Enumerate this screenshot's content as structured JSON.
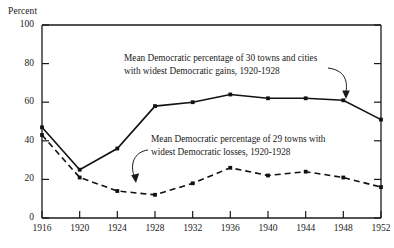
{
  "chart_data": {
    "type": "line",
    "title": "",
    "subtitle": "",
    "xlabel": "",
    "ylabel": "Percent",
    "grid": false,
    "legend_position": "inline-annotations",
    "x": [
      1916,
      1920,
      1924,
      1928,
      1932,
      1936,
      1940,
      1944,
      1948,
      1952
    ],
    "xtick_labels": [
      "1916",
      "1920",
      "1924",
      "1928",
      "1932",
      "1936",
      "1940",
      "1944",
      "1948",
      "1952"
    ],
    "ytick_labels": [
      "0",
      "20",
      "40",
      "60",
      "80",
      "100"
    ],
    "yticks": [
      0,
      20,
      40,
      60,
      80,
      100
    ],
    "xlim": [
      1916,
      1952
    ],
    "ylim": [
      0,
      100
    ],
    "series": [
      {
        "name": "Mean Democratic percentage of 30 towns and cities with widest Democratic gains, 1920-1928",
        "style": "solid",
        "color": "#111111",
        "marker": "dot",
        "values": [
          47,
          25,
          36,
          58,
          60,
          64,
          62,
          62,
          61,
          51
        ]
      },
      {
        "name": "Mean Democratic percentage of 29 towns with widest Democratic losses, 1920-1928",
        "style": "dashed",
        "color": "#111111",
        "marker": "dot",
        "values": [
          43,
          21,
          14,
          12,
          18,
          26,
          22,
          24,
          21,
          16
        ]
      }
    ],
    "annotations": [
      {
        "id": "gains",
        "lines": [
          "Mean Democratic percentage of 30 towns and cities",
          "with widest Democratic gains, 1920-1928"
        ],
        "points_to_series": 0,
        "points_to_x": 1948
      },
      {
        "id": "losses",
        "lines": [
          "Mean Democratic percentage of 29 towns with",
          "widest Democratic losses, 1920-1928"
        ],
        "points_to_series": 1,
        "points_to_x": 1926
      }
    ]
  }
}
